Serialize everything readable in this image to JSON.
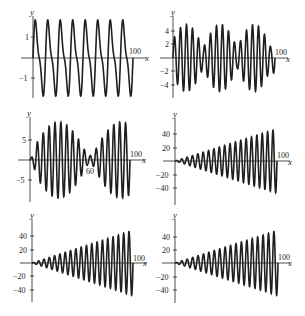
{
  "chart_data": [
    {
      "type": "line",
      "panel": "top-left",
      "xlabel": "x",
      "ylabel": "y",
      "x_tick_labels": [
        "100"
      ],
      "y_ticks": [
        1,
        -1
      ],
      "y_tick_labels": [
        "1",
        "−1"
      ],
      "xlim": [
        0,
        100
      ],
      "ylim": [
        -1.6,
        1.6
      ],
      "grid": false,
      "description": "Periodic sawtooth-like oscillation, amplitude ~1.5, about 8 cycles over 0-100",
      "series": [
        {
          "name": "f",
          "amplitude": 1.5,
          "cycles": 8,
          "shape": "skewed"
        }
      ]
    },
    {
      "type": "line",
      "panel": "top-right",
      "xlabel": "x",
      "ylabel": "y",
      "x_tick_labels": [
        "100"
      ],
      "y_ticks": [
        4,
        2,
        -2,
        -4
      ],
      "y_tick_labels": [
        "4",
        "2",
        "−2",
        "−4"
      ],
      "xlim": [
        0,
        100
      ],
      "ylim": [
        -5,
        5
      ],
      "grid": false,
      "description": "Beat pattern oscillation, amplitude up to ~5, three beat groups",
      "series": [
        {
          "name": "f",
          "amplitude": 5,
          "cycles": 17,
          "beats": 3
        }
      ]
    },
    {
      "type": "line",
      "panel": "middle-left",
      "xlabel": "x",
      "ylabel": "y",
      "x_tick_labels": [
        "100"
      ],
      "annotations": [
        "60"
      ],
      "y_ticks": [
        5,
        -5
      ],
      "y_tick_labels": [
        "5",
        "−5"
      ],
      "xlim": [
        0,
        100
      ],
      "ylim": [
        -10,
        10
      ],
      "grid": false,
      "description": "Beat oscillation with amplitude growing to ~10, envelope minimum near x=60",
      "series": [
        {
          "name": "f",
          "amplitude": 10,
          "cycles": 17,
          "envelope_min_x": 60
        }
      ]
    },
    {
      "type": "line",
      "panel": "middle-right",
      "xlabel": "x",
      "ylabel": "y",
      "x_tick_labels": [
        "100"
      ],
      "y_ticks": [
        40,
        20,
        -20,
        -40
      ],
      "y_tick_labels": [
        "40",
        "20",
        "−20",
        "−40"
      ],
      "xlim": [
        0,
        100
      ],
      "ylim": [
        -50,
        50
      ],
      "grid": false,
      "description": "Oscillation with linearly growing amplitude, from ~0 to ~48 at x=100",
      "series": [
        {
          "name": "f",
          "amplitude_start": 0,
          "amplitude_end": 48,
          "cycles": 19
        }
      ]
    },
    {
      "type": "line",
      "panel": "bottom-left",
      "xlabel": "x",
      "ylabel": "y",
      "x_tick_labels": [
        "100"
      ],
      "y_ticks": [
        40,
        20,
        -20,
        -40
      ],
      "y_tick_labels": [
        "40",
        "20",
        "−20",
        "−40"
      ],
      "xlim": [
        0,
        100
      ],
      "ylim": [
        -50,
        50
      ],
      "grid": false,
      "description": "Oscillation with linearly growing amplitude, from ~0 to ~48 at x=100",
      "series": [
        {
          "name": "f",
          "amplitude_start": 0,
          "amplitude_end": 48,
          "cycles": 19
        }
      ]
    },
    {
      "type": "line",
      "panel": "bottom-right",
      "xlabel": "x",
      "ylabel": "y",
      "x_tick_labels": [
        "100"
      ],
      "y_ticks": [
        40,
        20,
        -20,
        -40
      ],
      "y_tick_labels": [
        "40",
        "20",
        "−20",
        "−40"
      ],
      "xlim": [
        0,
        100
      ],
      "ylim": [
        -50,
        50
      ],
      "grid": false,
      "description": "Oscillation with linearly growing amplitude, from ~0 to ~48 at x=100",
      "series": [
        {
          "name": "f",
          "amplitude_start": 0,
          "amplitude_end": 48,
          "cycles": 19
        }
      ]
    }
  ],
  "panels": [
    {
      "y_axis_label": "y",
      "x_axis_label": "x",
      "x_end_label": "100",
      "ticks": [
        "1",
        "−1"
      ]
    },
    {
      "y_axis_label": "y",
      "x_axis_label": "x",
      "x_end_label": "100",
      "ticks": [
        "4",
        "2",
        "−2",
        "−4"
      ]
    },
    {
      "y_axis_label": "y",
      "x_axis_label": "x",
      "x_end_label": "100",
      "ticks": [
        "5",
        "−5"
      ],
      "annotation": "60"
    },
    {
      "y_axis_label": "y",
      "x_axis_label": "x",
      "x_end_label": "100",
      "ticks": [
        "40",
        "20",
        "−20",
        "−40"
      ]
    },
    {
      "y_axis_label": "y",
      "x_axis_label": "x",
      "x_end_label": "100",
      "ticks": [
        "40",
        "20",
        "−20",
        "−40"
      ]
    },
    {
      "y_axis_label": "y",
      "x_axis_label": "x",
      "x_end_label": "100",
      "ticks": [
        "40",
        "20",
        "−20",
        "−40"
      ]
    }
  ],
  "colors": {
    "ink": "#231f20",
    "background": "#ffffff"
  }
}
